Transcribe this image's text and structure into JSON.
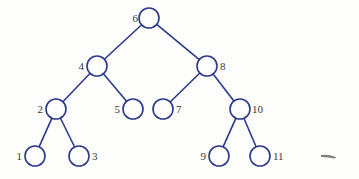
{
  "diagram": {
    "type": "binary-search-tree",
    "colors": {
      "stroke": "#2d3a8c",
      "label": "#3a3a3a",
      "background": "#fdfdfc",
      "smudge": "#555555"
    },
    "node_radius": 10,
    "nodes": [
      {
        "id": "n6",
        "label": "6",
        "cx": 149,
        "cy": 18,
        "lx": 138,
        "ly": 22,
        "anchor": "end"
      },
      {
        "id": "n4",
        "label": "4",
        "cx": 97,
        "cy": 66,
        "lx": 84,
        "ly": 70,
        "anchor": "end"
      },
      {
        "id": "n8",
        "label": "8",
        "cx": 207,
        "cy": 66,
        "lx": 220,
        "ly": 70,
        "anchor": "start"
      },
      {
        "id": "n2",
        "label": "2",
        "cx": 56,
        "cy": 109,
        "lx": 43,
        "ly": 113,
        "anchor": "end"
      },
      {
        "id": "n5",
        "label": "5",
        "cx": 133,
        "cy": 109,
        "lx": 120,
        "ly": 113,
        "anchor": "end"
      },
      {
        "id": "n7",
        "label": "7",
        "cx": 163,
        "cy": 109,
        "lx": 176,
        "ly": 113,
        "anchor": "start"
      },
      {
        "id": "n10",
        "label": "10",
        "cx": 240,
        "cy": 109,
        "lx": 252,
        "ly": 113,
        "anchor": "start"
      },
      {
        "id": "n1",
        "label": "1",
        "cx": 35,
        "cy": 156,
        "lx": 22,
        "ly": 160,
        "anchor": "end"
      },
      {
        "id": "n3",
        "label": "3",
        "cx": 79,
        "cy": 156,
        "lx": 92,
        "ly": 160,
        "anchor": "start"
      },
      {
        "id": "n9",
        "label": "9",
        "cx": 219,
        "cy": 156,
        "lx": 206,
        "ly": 160,
        "anchor": "end"
      },
      {
        "id": "n11",
        "label": "11",
        "cx": 260,
        "cy": 156,
        "lx": 273,
        "ly": 160,
        "anchor": "start"
      }
    ],
    "edges": [
      {
        "from": "n6",
        "to": "n4"
      },
      {
        "from": "n6",
        "to": "n8"
      },
      {
        "from": "n4",
        "to": "n2"
      },
      {
        "from": "n4",
        "to": "n5"
      },
      {
        "from": "n8",
        "to": "n7"
      },
      {
        "from": "n8",
        "to": "n10"
      },
      {
        "from": "n2",
        "to": "n1"
      },
      {
        "from": "n2",
        "to": "n3"
      },
      {
        "from": "n10",
        "to": "n9"
      },
      {
        "from": "n10",
        "to": "n11"
      }
    ]
  }
}
